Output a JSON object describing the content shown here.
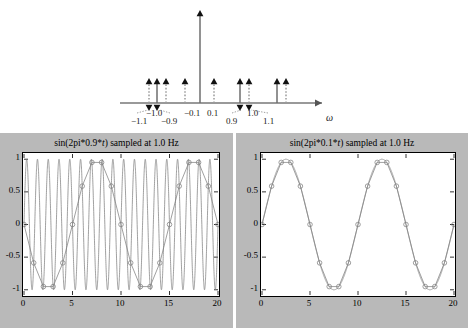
{
  "figure": {
    "spectrum": {
      "axis_label": "ω",
      "axis_label_name": "omega-axis-label",
      "tick_labels": [
        {
          "text": "−1.1",
          "x": 131,
          "y": 116
        },
        {
          "text": "−1.0",
          "x": 146,
          "y": 108
        },
        {
          "text": "−0.9",
          "x": 161,
          "y": 116
        },
        {
          "text": "−0.1",
          "x": 184,
          "y": 108
        },
        {
          "text": "0.1",
          "x": 207,
          "y": 108
        },
        {
          "text": "0.9",
          "x": 226,
          "y": 116
        },
        {
          "text": "1.0",
          "x": 247,
          "y": 108
        },
        {
          "text": "1.1",
          "x": 263,
          "y": 116
        }
      ],
      "impulses_up_solid": [
        157,
        200,
        240,
        277
      ],
      "impulses_up_dotted": [
        149,
        166,
        185,
        214,
        249,
        286
      ],
      "impulses_down": [
        149,
        157,
        240,
        249
      ],
      "center_impulse_x": 200,
      "baseline_y": 103,
      "axis_start_x": 120,
      "axis_end_x": 322
    },
    "plots": [
      {
        "name": "left",
        "title_pre": "sin(2pi*0.9*",
        "title_it": "t",
        "title_post": ") sampled at 1.0 Hz",
        "freq": 0.9,
        "fs": 1.0,
        "ytick_labels": [
          "1",
          "0.5",
          "0",
          "-0.5",
          "-1"
        ],
        "ytick_values": [
          1,
          0.5,
          0,
          -0.5,
          -1
        ],
        "xtick_labels": [
          "0",
          "5",
          "10",
          "15",
          "20"
        ],
        "xtick_values": [
          0,
          5,
          10,
          15,
          20
        ],
        "xlim": [
          0,
          20
        ],
        "ylim": [
          -1.08,
          1.08
        ]
      },
      {
        "name": "right",
        "title_pre": "sin(2pi*0.1*",
        "title_it": "t",
        "title_post": ") sampled at 1.0 Hz",
        "freq": 0.1,
        "fs": 1.0,
        "ytick_labels": [
          "1",
          "0.5",
          "0",
          "-0.5",
          "-1"
        ],
        "ytick_values": [
          1,
          0.5,
          0,
          -0.5,
          -1
        ],
        "xtick_labels": [
          "0",
          "5",
          "10",
          "15",
          "20"
        ],
        "xtick_values": [
          0,
          5,
          10,
          15,
          20
        ],
        "xlim": [
          0,
          20
        ],
        "ylim": [
          -1.08,
          1.08
        ]
      }
    ]
  },
  "chart_data": [
    {
      "type": "line",
      "title": "sin(2pi*0.9*t) sampled at 1.0 Hz",
      "xlabel": "",
      "ylabel": "",
      "xlim": [
        0,
        20
      ],
      "ylim": [
        -1.08,
        1.08
      ],
      "xticks": [
        0,
        5,
        10,
        15,
        20
      ],
      "yticks": [
        -1,
        -0.5,
        0,
        0.5,
        1
      ],
      "grid": false,
      "legend": "none",
      "series": [
        {
          "name": "sin(2pi*0.9*t) continuous",
          "style": "solid-line",
          "description": "continuous 0.9 Hz sine, 18 cycles over 0..20 s"
        },
        {
          "name": "samples at 1.0 Hz (circles joined by straight lines)",
          "style": "circles-with-line",
          "x": [
            0,
            1,
            2,
            3,
            4,
            5,
            6,
            7,
            8,
            9,
            10,
            11,
            12,
            13,
            14,
            15,
            16,
            17,
            18,
            19,
            20
          ],
          "values": [
            0,
            -0.588,
            -0.951,
            -0.951,
            -0.588,
            0,
            0.588,
            0.951,
            0.951,
            0.588,
            0,
            -0.588,
            -0.951,
            -0.951,
            -0.588,
            0,
            0.588,
            0.951,
            0.951,
            0.588,
            0
          ]
        }
      ]
    },
    {
      "type": "line",
      "title": "sin(2pi*0.1*t) sampled at 1.0 Hz",
      "xlabel": "",
      "ylabel": "",
      "xlim": [
        0,
        20
      ],
      "ylim": [
        -1.08,
        1.08
      ],
      "xticks": [
        0,
        5,
        10,
        15,
        20
      ],
      "yticks": [
        -1,
        -0.5,
        0,
        0.5,
        1
      ],
      "grid": false,
      "legend": "none",
      "series": [
        {
          "name": "sin(2pi*0.1*t) continuous",
          "style": "solid-line",
          "description": "continuous 0.1 Hz sine, 2 cycles over 0..20 s"
        },
        {
          "name": "samples at 1.0 Hz (circles joined by straight lines)",
          "style": "circles-with-line",
          "x": [
            0,
            1,
            2,
            3,
            4,
            5,
            6,
            7,
            8,
            9,
            10,
            11,
            12,
            13,
            14,
            15,
            16,
            17,
            18,
            19,
            20
          ],
          "values": [
            0,
            0.588,
            0.951,
            0.951,
            0.588,
            0,
            -0.588,
            -0.951,
            -0.951,
            -0.588,
            0,
            0.588,
            0.951,
            0.951,
            0.588,
            0,
            -0.588,
            -0.951,
            -0.951,
            -0.588,
            0
          ]
        }
      ]
    },
    {
      "type": "scatter",
      "title": "Aliasing: spectrum of sampled signal",
      "xlabel": "ω",
      "ylabel": "",
      "grid": false,
      "legend": "none",
      "annotations": [
        "−1.1",
        "−1.0",
        "−0.9",
        "−0.1",
        "0.1",
        "0.9",
        "1.0",
        "1.1"
      ],
      "frequencies": [
        -1.1,
        -1.0,
        -0.9,
        -0.1,
        0.1,
        0.9,
        1.0,
        1.1
      ],
      "description": "Impulse train with upward and downward arrows; tall impulse at origin"
    }
  ],
  "colors": {
    "panel_background": "#b9b9b9",
    "axes_background": "#ffffff",
    "line": "#808080",
    "ink": "#1a1a1a",
    "page_background": "#ffffff"
  }
}
